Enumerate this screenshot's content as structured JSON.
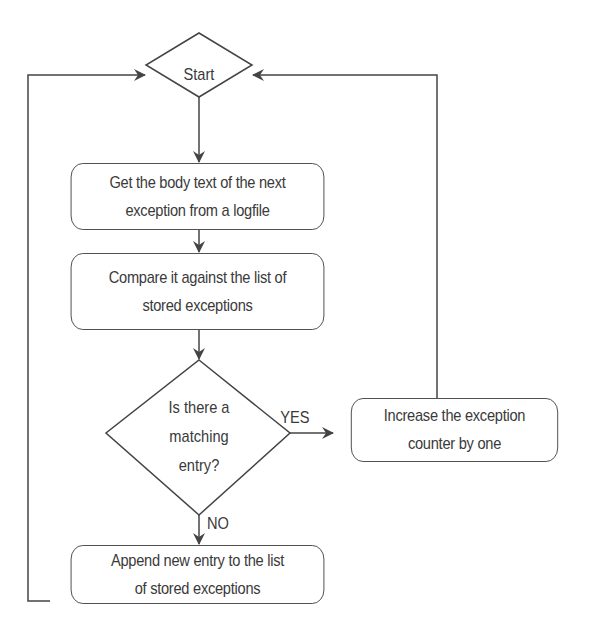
{
  "diagram": {
    "type": "flowchart",
    "nodes": {
      "start": {
        "shape": "diamond",
        "label": "Start"
      },
      "get_body": {
        "shape": "rounded-rect",
        "line1": "Get the body text of the next",
        "line2": "exception from a logfile"
      },
      "compare": {
        "shape": "rounded-rect",
        "line1": "Compare it against the list of",
        "line2": "stored exceptions"
      },
      "decision": {
        "shape": "diamond",
        "line1": "Is there a",
        "line2": "matching",
        "line3": "entry?"
      },
      "increase": {
        "shape": "rounded-rect",
        "line1": "Increase the exception",
        "line2": "counter by one"
      },
      "append": {
        "shape": "rounded-rect",
        "line1": "Append new entry to the list",
        "line2": "of stored exceptions"
      }
    },
    "edges": [
      {
        "from": "start",
        "to": "get_body",
        "label": ""
      },
      {
        "from": "get_body",
        "to": "compare",
        "label": ""
      },
      {
        "from": "compare",
        "to": "decision",
        "label": ""
      },
      {
        "from": "decision",
        "to": "increase",
        "label": "YES"
      },
      {
        "from": "decision",
        "to": "append",
        "label": "NO"
      },
      {
        "from": "increase",
        "to": "start",
        "label": ""
      },
      {
        "from": "append",
        "to": "start",
        "label": ""
      }
    ],
    "edge_labels": {
      "yes": "YES",
      "no": "NO"
    },
    "colors": {
      "stroke": "#444444",
      "text": "#3a3a3a",
      "background": "#ffffff"
    }
  }
}
